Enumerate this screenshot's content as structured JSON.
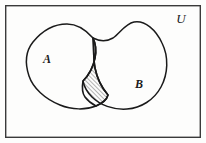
{
  "figure": {
    "kind": "venn-diagram",
    "caption_alt": "Two overlapping sets A and B inside universal set U with the intersection shaded",
    "background_color": "#fdfdfc"
  },
  "universe": {
    "label": "U",
    "label_x": 181,
    "label_y": 23,
    "font_size": 13,
    "border_color": "#3a3a3a",
    "border_width": 1.4,
    "rect": {
      "x": 5,
      "y": 5,
      "width": 196,
      "height": 133
    }
  },
  "sets": [
    {
      "id": "A",
      "label": "A",
      "label_x": 47,
      "label_y": 63,
      "font_size": 12,
      "outline_color": "#1a1a1a",
      "outline_width": 1.5,
      "fill": "none",
      "path": "M 93 38 C 86 30 78 24 67 24 C 54 24 42 31 33 42 C 25 52 25 64 29 76 C 33 88 45 99 60 105 C 72 110 86 110 96 106 C 103 103 107 99 108 95 C 102 88 97 78 95 68 C 93 57 94 46 93 38 Z"
    },
    {
      "id": "B",
      "label": "B",
      "label_x": 139,
      "label_y": 88,
      "font_size": 12,
      "outline_color": "#1a1a1a",
      "outline_width": 1.5,
      "fill": "none",
      "path": "M 93 38 C 99 41 106 42 113 38 C 120 33 125 24 134 22 C 145 20 156 30 162 43 C 169 57 168 74 161 87 C 154 100 141 108 127 109 C 113 110 100 105 92 97 C 87 92 84 86 83 81 C 88 76 93 68 95 58 C 97 48 95 42 93 38 Z"
    }
  ],
  "intersection": {
    "id": "A-intersect-B",
    "label": "",
    "shaded": true,
    "hatch_color": "#2a2a2a",
    "hatch_angle_deg": 45,
    "hatch_spacing": 3,
    "hatch_line_width": 0.7,
    "outline_color": "#1a1a1a",
    "outline_width": 1.6,
    "path": "M 93 38 C 94 46 93 57 95 68 C 97 78 102 88 108 95 C 107 99 103 103 96 106 C 92 104 88 101 85 97 C 82 93 82 87 83 81 C 88 76 93 68 95 58 C 97 48 95 42 93 38 Z",
    "path_full": "M 93.5 38 C 90 44 89 52 88 60 C 87 70 84 77 83 82 C 82 89 84 95 89 100 C 94 105 101 107 106 105 C 110 103 112 99 112 95 C 110 88 105 80 102 70 C 99 59 98 46 96 39 Z"
  },
  "strokes": {
    "ink": "#1a1a1a",
    "frame": "#3a3a3a"
  }
}
